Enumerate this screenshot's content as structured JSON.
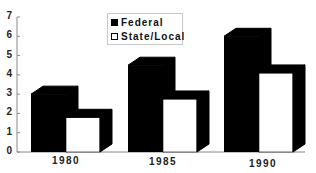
{
  "chart_data": {
    "type": "bar",
    "style": "3d-grouped",
    "title": "",
    "xlabel": "",
    "ylabel": "",
    "categories": [
      "1980",
      "1985",
      "1990"
    ],
    "series": [
      {
        "name": "Federal",
        "color": "#000000",
        "values": [
          3.0,
          4.5,
          6.0
        ]
      },
      {
        "name": "State/Local",
        "color": "#ffffff",
        "values": [
          1.8,
          2.75,
          4.1
        ]
      }
    ],
    "yticks": [
      "0",
      "1",
      "2",
      "3",
      "4",
      "5",
      "6",
      "7"
    ],
    "ylim": [
      0,
      7
    ],
    "grid": false,
    "legend_position": "top-center"
  },
  "legend": {
    "items": [
      {
        "label": "Federal",
        "color": "#000000"
      },
      {
        "label": "State/Local",
        "color": "#ffffff"
      }
    ]
  }
}
